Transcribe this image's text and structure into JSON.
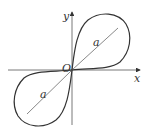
{
  "diagram": {
    "type": "lemniscate",
    "axes": {
      "x_label": "x",
      "y_label": "y",
      "origin_label": "O"
    },
    "segment_labels": [
      "a",
      "a"
    ],
    "colors": {
      "stroke": "#333333",
      "background": "#ffffff"
    }
  }
}
